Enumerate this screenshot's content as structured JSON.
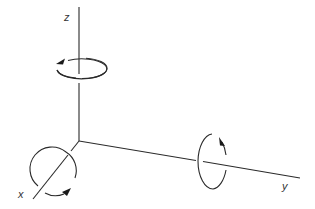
{
  "diagram": {
    "origin": [
      79,
      141
    ],
    "colors": {
      "line": "#2a2a2a",
      "arrow": "#1a1a1a",
      "label": "#333333",
      "background": "#ffffff"
    },
    "axes": [
      {
        "name": "z",
        "label": "z",
        "end": [
          79,
          7
        ],
        "label_pos": [
          64,
          21
        ],
        "rotation": {
          "shape": "ellipse",
          "center": [
            82,
            68
          ],
          "rx": 25,
          "ry": 10,
          "arrow_direction": "counterclockwise-viewed-from-above",
          "arrow_at": [
            58,
            62
          ]
        }
      },
      {
        "name": "x",
        "label": "x",
        "end": [
          33,
          199
        ],
        "label_pos": [
          18,
          198
        ],
        "rotation": {
          "shape": "circle",
          "center": [
            54,
            171
          ],
          "r": 22,
          "arrow_direction": "counterclockwise-around-axis",
          "arrow_at": [
            70,
            191
          ]
        }
      },
      {
        "name": "y",
        "label": "y",
        "end": [
          300,
          178
        ],
        "label_pos": [
          282,
          190
        ],
        "rotation": {
          "shape": "ellipse",
          "center": [
            213,
            161
          ],
          "rx": 15,
          "ry": 28,
          "arrow_direction": "counterclockwise-around-axis",
          "arrow_at": [
            222,
            139
          ]
        }
      }
    ]
  }
}
